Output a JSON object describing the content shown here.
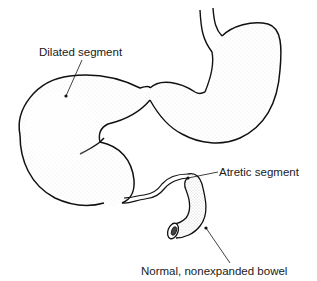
{
  "diagram": {
    "labels": {
      "dilated": "Dilated segment",
      "atretic": "Atretic segment",
      "normal": "Normal, nonexpanded bowel"
    },
    "colors": {
      "line": "#111111",
      "stipple": "#8a8a8a",
      "background": "#ffffff"
    }
  }
}
